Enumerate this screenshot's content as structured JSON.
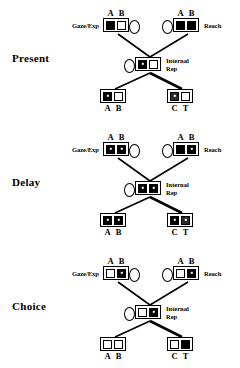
{
  "figure": {
    "kind": "three-panel-network-diagram",
    "panel_count": 3,
    "colors": {
      "ink": "#000000",
      "paper": "#ffffff",
      "grey_fill": "#2b2b2b"
    }
  },
  "labels": {
    "gaze_exp": "Gaze/Exp",
    "reach": "Reach",
    "internal_rep": "Internal Rep",
    "internal_rep_line1": "Internal",
    "internal_rep_line2": "Rep",
    "cells_ab": [
      "A",
      "B"
    ],
    "cells_ct": [
      "C",
      "T"
    ]
  },
  "panels": [
    {
      "title": "Present",
      "nodes": {
        "top_left": {
          "name": "gaze-exp",
          "side_label": "Gaze/Exp",
          "label_side": "left",
          "labels_top": [
            "A",
            "B"
          ],
          "cells": [
            "black",
            "white"
          ],
          "ellipse": "right"
        },
        "top_right": {
          "name": "reach",
          "side_label": "Reach",
          "label_side": "right",
          "labels_top": [
            "A",
            "B"
          ],
          "cells": [
            "black",
            "black"
          ],
          "ellipse": "left"
        },
        "center": {
          "name": "internal-rep",
          "side_label": "Internal Rep",
          "label_side": "right",
          "labels_top": [],
          "cells": [
            "black-dot",
            "white"
          ],
          "ellipse": "left"
        },
        "bottom_left": {
          "name": "output-ab",
          "labels_bottom": [
            "A",
            "B"
          ],
          "cells": [
            "black-dot",
            "white"
          ]
        },
        "bottom_right": {
          "name": "output-ct",
          "labels_bottom": [
            "C",
            "T"
          ],
          "cells": [
            "grey",
            "white"
          ]
        }
      }
    },
    {
      "title": "Delay",
      "nodes": {
        "top_left": {
          "name": "gaze-exp",
          "side_label": "Gaze/Exp",
          "label_side": "left",
          "labels_top": [
            "A",
            "B"
          ],
          "cells": [
            "black-dot",
            "black-dot"
          ],
          "ellipse": "right"
        },
        "top_right": {
          "name": "reach",
          "side_label": "Reach",
          "label_side": "right",
          "labels_top": [
            "A",
            "B"
          ],
          "cells": [
            "black",
            "black-dot"
          ],
          "ellipse": "left"
        },
        "center": {
          "name": "internal-rep",
          "side_label": "Internal Rep",
          "label_side": "right",
          "labels_top": [],
          "cells": [
            "black-dot",
            "black-dot"
          ],
          "ellipse": "left"
        },
        "bottom_left": {
          "name": "output-ab",
          "labels_bottom": [
            "A",
            "B"
          ],
          "cells": [
            "black-dot",
            "black-dot"
          ]
        },
        "bottom_right": {
          "name": "output-ct",
          "labels_bottom": [
            "C",
            "T"
          ],
          "cells": [
            "black-dot",
            "grey"
          ]
        }
      }
    },
    {
      "title": "Choice",
      "nodes": {
        "top_left": {
          "name": "gaze-exp",
          "side_label": "Gaze/Exp",
          "label_side": "left",
          "labels_top": [
            "A",
            "B"
          ],
          "cells": [
            "white",
            "black-dot"
          ],
          "ellipse": "right"
        },
        "top_right": {
          "name": "reach",
          "side_label": "Reach",
          "label_side": "right",
          "labels_top": [
            "A",
            "B"
          ],
          "cells": [
            "white",
            "black-dot"
          ],
          "ellipse": "left"
        },
        "center": {
          "name": "internal-rep",
          "side_label": "Internal Rep",
          "label_side": "right",
          "labels_top": [],
          "cells": [
            "white",
            "black-dot"
          ],
          "ellipse": "left"
        },
        "bottom_left": {
          "name": "output-ab",
          "labels_bottom": [
            "A",
            "B"
          ],
          "cells": [
            "white",
            "white"
          ]
        },
        "bottom_right": {
          "name": "output-ct",
          "labels_bottom": [
            "C",
            "T"
          ],
          "cells": [
            "white",
            "black"
          ]
        }
      }
    }
  ]
}
